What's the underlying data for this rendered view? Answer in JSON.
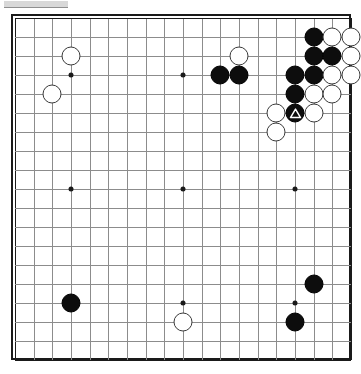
{
  "app": {
    "title": "Go Board Position",
    "window_strip_label": ""
  },
  "board": {
    "name": "go-goban",
    "size": 19,
    "line_color": "#8c8c8c",
    "edge_color": "#1a1a1a",
    "background_color": "#ffffff",
    "black_color": "#0d0d0d",
    "white_color": "#ffffff",
    "star_points": [
      {
        "col": 4,
        "row": 4
      },
      {
        "col": 10,
        "row": 4
      },
      {
        "col": 16,
        "row": 4
      },
      {
        "col": 4,
        "row": 10
      },
      {
        "col": 10,
        "row": 10
      },
      {
        "col": 16,
        "row": 10
      },
      {
        "col": 4,
        "row": 16
      },
      {
        "col": 10,
        "row": 16
      },
      {
        "col": 16,
        "row": 16
      }
    ],
    "stones": [
      {
        "col": 4,
        "row": 3,
        "color": "white",
        "mark": ""
      },
      {
        "col": 3,
        "row": 5,
        "color": "white",
        "mark": ""
      },
      {
        "col": 13,
        "row": 3,
        "color": "white",
        "mark": ""
      },
      {
        "col": 12,
        "row": 4,
        "color": "black",
        "mark": ""
      },
      {
        "col": 13,
        "row": 4,
        "color": "black",
        "mark": ""
      },
      {
        "col": 17,
        "row": 2,
        "color": "black",
        "mark": ""
      },
      {
        "col": 18,
        "row": 2,
        "color": "white",
        "mark": ""
      },
      {
        "col": 19,
        "row": 2,
        "color": "white",
        "mark": ""
      },
      {
        "col": 17,
        "row": 3,
        "color": "black",
        "mark": ""
      },
      {
        "col": 18,
        "row": 3,
        "color": "black",
        "mark": ""
      },
      {
        "col": 19,
        "row": 3,
        "color": "white",
        "mark": ""
      },
      {
        "col": 16,
        "row": 4,
        "color": "black",
        "mark": ""
      },
      {
        "col": 17,
        "row": 4,
        "color": "black",
        "mark": ""
      },
      {
        "col": 18,
        "row": 4,
        "color": "white",
        "mark": ""
      },
      {
        "col": 19,
        "row": 4,
        "color": "white",
        "mark": ""
      },
      {
        "col": 16,
        "row": 5,
        "color": "black",
        "mark": ""
      },
      {
        "col": 17,
        "row": 5,
        "color": "white",
        "mark": ""
      },
      {
        "col": 18,
        "row": 5,
        "color": "white",
        "mark": ""
      },
      {
        "col": 15,
        "row": 6,
        "color": "white",
        "mark": ""
      },
      {
        "col": 16,
        "row": 6,
        "color": "black",
        "mark": "triangle"
      },
      {
        "col": 17,
        "row": 6,
        "color": "white",
        "mark": ""
      },
      {
        "col": 15,
        "row": 7,
        "color": "white",
        "mark": ""
      },
      {
        "col": 4,
        "row": 16,
        "color": "black",
        "mark": ""
      },
      {
        "col": 10,
        "row": 17,
        "color": "white",
        "mark": ""
      },
      {
        "col": 17,
        "row": 15,
        "color": "black",
        "mark": ""
      },
      {
        "col": 16,
        "row": 17,
        "color": "black",
        "mark": ""
      }
    ],
    "marks": {
      "triangle_color": "#ffffff",
      "triangle_label": "triangle-mark"
    }
  }
}
